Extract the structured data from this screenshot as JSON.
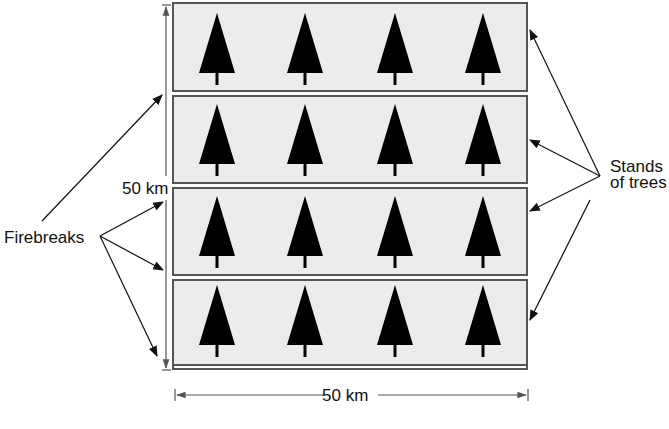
{
  "diagram": {
    "region": {
      "width_label": "50 km",
      "height_label": "50 km",
      "rows": 4,
      "trees_per_row": 4,
      "fill_color": "#ececec",
      "border_color": "#555555",
      "tree_color": "#000000"
    },
    "labels": {
      "firebreaks": "Firebreaks",
      "stands_line1": "Stands",
      "stands_line2": "of trees",
      "width_dim": "50 km",
      "height_dim": "50 km"
    },
    "firebreak_arrows": 4,
    "stand_arrows": 4
  }
}
